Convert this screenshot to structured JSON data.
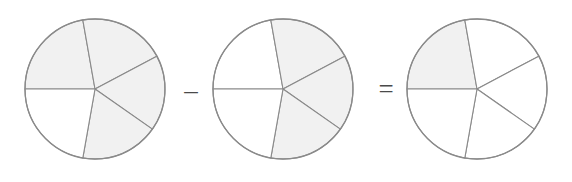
{
  "diagram": {
    "type": "fraction-subtraction-pies",
    "equation_text": "4/5 - 3/5 = 1/5",
    "sectors_per_circle": 5,
    "geometry": {
      "radius": 70,
      "center_y": 89,
      "boundary_angles_deg": [
        180,
        100,
        28,
        -35,
        -100
      ]
    },
    "colors": {
      "shaded_fill": "#f1f1f1",
      "unshaded_fill": "#ffffff",
      "stroke": "#8a8a8a",
      "operator": "#4a4a4a"
    },
    "circles": [
      {
        "name": "minuend",
        "center_x": 95,
        "shaded_count": 4,
        "total_count": 5,
        "fraction_label": "4/5",
        "sectors": [
          {
            "index": 0,
            "start_deg": 100,
            "end_deg": 180,
            "shaded": true
          },
          {
            "index": 1,
            "start_deg": 28,
            "end_deg": 100,
            "shaded": true
          },
          {
            "index": 2,
            "start_deg": -35,
            "end_deg": 28,
            "shaded": true
          },
          {
            "index": 3,
            "start_deg": -100,
            "end_deg": -35,
            "shaded": true
          },
          {
            "index": 4,
            "start_deg": -180,
            "end_deg": -100,
            "shaded": false
          }
        ]
      },
      {
        "name": "subtrahend",
        "center_x": 283,
        "shaded_count": 3,
        "total_count": 5,
        "fraction_label": "3/5",
        "sectors": [
          {
            "index": 0,
            "start_deg": 100,
            "end_deg": 180,
            "shaded": false
          },
          {
            "index": 1,
            "start_deg": 28,
            "end_deg": 100,
            "shaded": true
          },
          {
            "index": 2,
            "start_deg": -35,
            "end_deg": 28,
            "shaded": true
          },
          {
            "index": 3,
            "start_deg": -100,
            "end_deg": -35,
            "shaded": true
          },
          {
            "index": 4,
            "start_deg": -180,
            "end_deg": -100,
            "shaded": false
          }
        ]
      },
      {
        "name": "difference",
        "center_x": 477,
        "shaded_count": 1,
        "total_count": 5,
        "fraction_label": "1/5",
        "sectors": [
          {
            "index": 0,
            "start_deg": 100,
            "end_deg": 180,
            "shaded": true
          },
          {
            "index": 1,
            "start_deg": 28,
            "end_deg": 100,
            "shaded": false
          },
          {
            "index": 2,
            "start_deg": -35,
            "end_deg": 28,
            "shaded": false
          },
          {
            "index": 3,
            "start_deg": -100,
            "end_deg": -35,
            "shaded": false
          },
          {
            "index": 4,
            "start_deg": -180,
            "end_deg": -100,
            "shaded": false
          }
        ]
      }
    ],
    "operators": [
      {
        "name": "minus",
        "symbol": "–",
        "x": 177,
        "y": 70
      },
      {
        "name": "equals",
        "symbol": "=",
        "x": 372,
        "y": 69
      }
    ]
  }
}
